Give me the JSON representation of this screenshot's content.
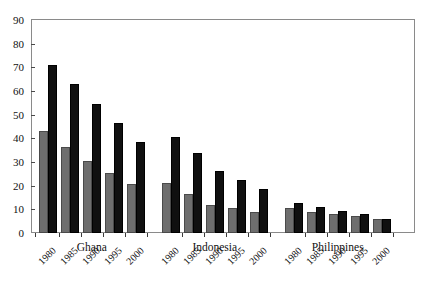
{
  "chart_data": {
    "type": "bar",
    "title": "",
    "subtitle": "",
    "xlabel": "",
    "ylabel": "",
    "ylim": [
      0,
      90
    ],
    "ytick_step": 10,
    "yticks": [
      0,
      10,
      20,
      30,
      40,
      50,
      60,
      70,
      80,
      90
    ],
    "ytick_labels": [
      "0",
      "10",
      "20",
      "30",
      "40",
      "50",
      "60",
      "70",
      "80",
      "90"
    ],
    "grid": false,
    "legend": "none",
    "orientation": "vertical",
    "grouping": "grouped",
    "categories": [
      "1980",
      "1985",
      "1990",
      "1995",
      "2000"
    ],
    "groups": [
      {
        "name": "Ghana",
        "years": [
          "1980",
          "1985",
          "1990",
          "1995",
          "2000"
        ],
        "series": [
          {
            "name": "gray",
            "color": "#6e6e6e",
            "values": [
              43,
              36.5,
              30.5,
              25.5,
              20.5
            ]
          },
          {
            "name": "black",
            "color": "#101010",
            "values": [
              71,
              63,
              54.5,
              46.5,
              38.5
            ]
          }
        ]
      },
      {
        "name": "Indonesia",
        "years": [
          "1980",
          "1985",
          "1990",
          "1995",
          "2000"
        ],
        "series": [
          {
            "name": "gray",
            "color": "#6e6e6e",
            "values": [
              21,
              16.5,
              12,
              10.5,
              9
            ]
          },
          {
            "name": "black",
            "color": "#101010",
            "values": [
              40.5,
              34,
              26,
              22.5,
              18.5
            ]
          }
        ]
      },
      {
        "name": "Philippines",
        "years": [
          "1980",
          "1985",
          "1990",
          "1995",
          "2000"
        ],
        "series": [
          {
            "name": "gray",
            "color": "#6e6e6e",
            "values": [
              10.5,
              9,
              8,
              7,
              6
            ]
          },
          {
            "name": "black",
            "color": "#101010",
            "values": [
              12.5,
              11,
              9.5,
              8,
              6
            ]
          }
        ]
      }
    ],
    "colors": {
      "series_gray": "#6e6e6e",
      "series_black": "#101010",
      "frame": "#8a8a8a",
      "text": "#111111",
      "background": "#ffffff"
    }
  }
}
